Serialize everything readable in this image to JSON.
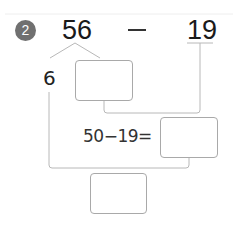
{
  "problem": {
    "number": "2",
    "minuend": "56",
    "operator": "—",
    "subtrahend": "19",
    "decomposed_part": "6",
    "equation": "50−19=",
    "answer_boxes": [
      "",
      "",
      ""
    ]
  },
  "colors": {
    "badge": "#707070",
    "lines": "#b8b8b8",
    "box_border": "#a9a9a9"
  }
}
